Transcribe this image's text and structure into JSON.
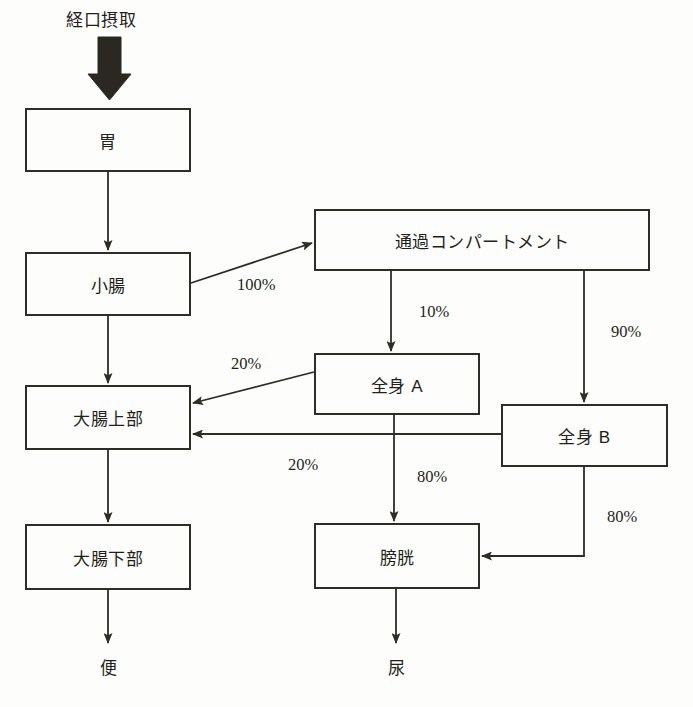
{
  "diagram": {
    "stroke_color": "#2e2c26",
    "text_color": "#221f1a",
    "background_color": "#fdfdfb",
    "nodes": [
      {
        "id": "stomach",
        "label": "胃",
        "x": 25,
        "y": 108,
        "w": 166,
        "h": 64
      },
      {
        "id": "small-intestine",
        "label": "小腸",
        "x": 25,
        "y": 252,
        "w": 166,
        "h": 64
      },
      {
        "id": "transit",
        "label": "通過コンパートメント",
        "x": 314,
        "y": 209,
        "w": 336,
        "h": 62
      },
      {
        "id": "systemic-a",
        "label": "全身 A",
        "x": 314,
        "y": 353,
        "w": 166,
        "h": 62
      },
      {
        "id": "systemic-b",
        "label": "全身 B",
        "x": 501,
        "y": 404,
        "w": 167,
        "h": 63
      },
      {
        "id": "upper-colon",
        "label": "大腸上部",
        "x": 25,
        "y": 385,
        "w": 166,
        "h": 65
      },
      {
        "id": "lower-colon",
        "label": "大腸下部",
        "x": 25,
        "y": 524,
        "w": 166,
        "h": 66
      },
      {
        "id": "bladder",
        "label": "膀胱",
        "x": 314,
        "y": 523,
        "w": 166,
        "h": 66
      }
    ],
    "free_labels": [
      {
        "id": "oral-intake",
        "label": "経口摂取",
        "x": 66,
        "y": 6
      },
      {
        "id": "feces",
        "label": "便",
        "x": 100,
        "y": 654
      },
      {
        "id": "urine",
        "label": "尿",
        "x": 388,
        "y": 654
      }
    ],
    "edge_labels": [
      {
        "id": "si-to-transit",
        "label": "100%",
        "x": 237,
        "y": 275
      },
      {
        "id": "transit-to-a",
        "label": "10%",
        "x": 419,
        "y": 302
      },
      {
        "id": "transit-to-b",
        "label": "90%",
        "x": 611,
        "y": 322
      },
      {
        "id": "a-to-upper-colon",
        "label": "20%",
        "x": 231,
        "y": 354
      },
      {
        "id": "b-to-upper-colon",
        "label": "20%",
        "x": 288,
        "y": 455
      },
      {
        "id": "a-to-bladder",
        "label": "80%",
        "x": 417,
        "y": 467
      },
      {
        "id": "b-to-bladder",
        "label": "80%",
        "x": 607,
        "y": 507
      }
    ],
    "edges": [
      {
        "id": "intake-to-stomach",
        "from": "oral-intake",
        "to": "stomach",
        "style": "thick-block-arrow"
      },
      {
        "id": "stomach-to-si",
        "from": "stomach",
        "to": "small-intestine",
        "style": "straight-vertical"
      },
      {
        "id": "si-to-transit",
        "from": "small-intestine",
        "to": "transit",
        "style": "diagonal",
        "value": "100%"
      },
      {
        "id": "si-to-upper-colon",
        "from": "small-intestine",
        "to": "upper-colon",
        "style": "straight-vertical"
      },
      {
        "id": "transit-to-a",
        "from": "transit",
        "to": "systemic-a",
        "style": "straight-vertical",
        "value": "10%"
      },
      {
        "id": "transit-to-b",
        "from": "transit",
        "to": "systemic-b",
        "style": "straight-vertical",
        "value": "90%"
      },
      {
        "id": "a-to-upper-colon",
        "from": "systemic-a",
        "to": "upper-colon",
        "style": "diagonal",
        "value": "20%"
      },
      {
        "id": "b-to-upper-colon",
        "from": "systemic-b",
        "to": "upper-colon",
        "style": "straight-horizontal",
        "value": "20%"
      },
      {
        "id": "a-to-bladder",
        "from": "systemic-a",
        "to": "bladder",
        "style": "straight-vertical",
        "value": "80%"
      },
      {
        "id": "b-to-bladder",
        "from": "systemic-b",
        "to": "bladder",
        "style": "elbow",
        "value": "80%"
      },
      {
        "id": "upper-to-lower-colon",
        "from": "upper-colon",
        "to": "lower-colon",
        "style": "straight-vertical"
      },
      {
        "id": "lower-colon-to-feces",
        "from": "lower-colon",
        "to": "feces",
        "style": "straight-vertical"
      },
      {
        "id": "bladder-to-urine",
        "from": "bladder",
        "to": "urine",
        "style": "straight-vertical"
      }
    ]
  }
}
